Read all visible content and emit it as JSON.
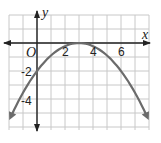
{
  "chart_data": {
    "type": "line",
    "title": "",
    "xlabel": "x",
    "ylabel": "y",
    "origin_label": "O",
    "xlim": [
      -2,
      8
    ],
    "ylim": [
      -6,
      2
    ],
    "grid": true,
    "x_tick_labels": [
      "2",
      "4",
      "6"
    ],
    "x_tick_values": [
      2,
      4,
      6
    ],
    "y_tick_labels": [
      "-2",
      "-4"
    ],
    "y_tick_values": [
      -2,
      -4
    ],
    "series": [
      {
        "name": "parabola",
        "equation": "y = -(2/9)(x - 3)^2",
        "vertex": [
          3,
          0
        ],
        "y_intercept": -2,
        "x": [
          -2,
          -1,
          0,
          1,
          2,
          3,
          4,
          5,
          6,
          7,
          8
        ],
        "y": [
          -5.56,
          -3.56,
          -2,
          -0.89,
          -0.22,
          0,
          -0.22,
          -0.89,
          -2,
          -3.56,
          -5.56
        ],
        "color": "#6b6b6b",
        "arrows_both_ends": true
      }
    ],
    "colors": {
      "grid": "#c8c8c8",
      "axis": "#222222",
      "curve": "#6b6b6b"
    }
  }
}
